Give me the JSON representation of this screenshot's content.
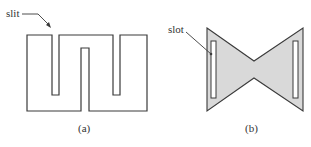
{
  "figure": {
    "panels": [
      {
        "id": "a",
        "caption": "(a)",
        "annotation": "slit",
        "shape": "meander antenna with slits"
      },
      {
        "id": "b",
        "caption": "(b)",
        "annotation": "slot",
        "shape": "bowtie antenna with slots"
      }
    ],
    "colors": {
      "stroke": "#3a3a3a",
      "fill_b": "#d9d9d9",
      "background": "#ffffff"
    }
  }
}
